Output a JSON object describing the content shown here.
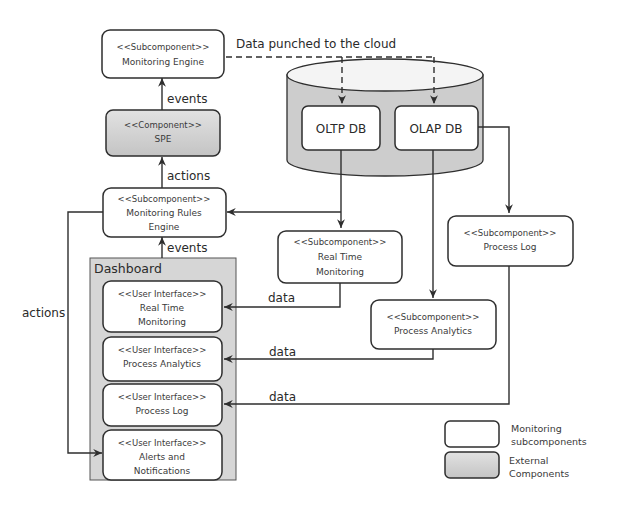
{
  "components": {
    "monitoring_engine": {
      "stereotype": "<<Subcomponent>>",
      "name": "Monitoring Engine"
    },
    "spe": {
      "stereotype": "<<Component>>",
      "name": "SPE"
    },
    "monitoring_rules_engine": {
      "stereotype": "<<Subcomponent>>",
      "name_line1": "Monitoring Rules",
      "name_line2": "Engine"
    },
    "oltp_db": {
      "name": "OLTP DB"
    },
    "olap_db": {
      "name": "OLAP DB"
    },
    "real_time_monitoring": {
      "stereotype": "<<Subcomponent>>",
      "name_line1": "Real Time",
      "name_line2": "Monitoring"
    },
    "process_analytics": {
      "stereotype": "<<Subcomponent>>",
      "name": "Process Analytics"
    },
    "process_log": {
      "stereotype": "<<Subcomponent>>",
      "name": "Process Log"
    }
  },
  "dashboard": {
    "title": "Dashboard",
    "items": [
      {
        "stereotype": "<<User Interface>>",
        "name_line1": "Real Time",
        "name_line2": "Monitoring"
      },
      {
        "stereotype": "<<User Interface>>",
        "name_line1": "Process Analytics",
        "name_line2": ""
      },
      {
        "stereotype": "<<User Interface>>",
        "name_line1": "Process Log",
        "name_line2": ""
      },
      {
        "stereotype": "<<User Interface>>",
        "name_line1": "Alerts and",
        "name_line2": "Notifications"
      }
    ]
  },
  "edges": {
    "cloud": "Data punched to the cloud",
    "events_top": "events",
    "actions_top": "actions",
    "events_bottom": "events",
    "actions_left": "actions",
    "data_rtm": "data",
    "data_pa": "data",
    "data_pl": "data"
  },
  "legend": {
    "monitoring_line1": "Monitoring",
    "monitoring_line2": "subcomponents",
    "external_line1": "External",
    "external_line2": "Components"
  },
  "colors": {
    "external_fill": "#cfcfcf",
    "dashboard_fill": "#d6d6d6",
    "stroke": "#2e2e2e"
  }
}
